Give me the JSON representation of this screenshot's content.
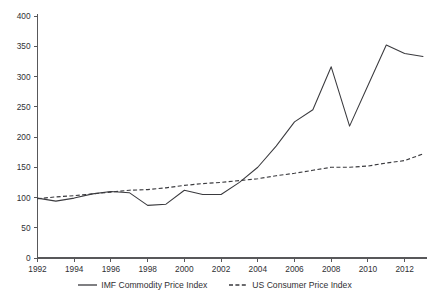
{
  "chart_data": {
    "type": "line",
    "title": "",
    "subtitle": "",
    "xlabel": "",
    "ylabel": "",
    "xlim": [
      1992,
      2013
    ],
    "ylim": [
      0,
      400
    ],
    "grid": false,
    "legend_position": "bottom",
    "x": [
      1992,
      1993,
      1994,
      1995,
      1996,
      1997,
      1998,
      1999,
      2000,
      2001,
      2002,
      2003,
      2004,
      2005,
      2006,
      2007,
      2008,
      2009,
      2010,
      2011,
      2012,
      2013
    ],
    "y_ticks": [
      0,
      50,
      100,
      150,
      200,
      250,
      300,
      350,
      400
    ],
    "y_tick_labels": [
      "0",
      "50",
      "100",
      "150",
      "200",
      "250",
      "300",
      "350",
      "400"
    ],
    "x_ticks": [
      1992,
      1994,
      1996,
      1998,
      2000,
      2002,
      2004,
      2006,
      2008,
      2010,
      2012
    ],
    "x_tick_labels": [
      "1992",
      "1994",
      "1996",
      "1998",
      "2000",
      "2002",
      "2004",
      "2006",
      "2008",
      "2010",
      "2012"
    ],
    "series": [
      {
        "name": "IMF Commodity Price Index",
        "style": "solid",
        "color": "#3a3a3e",
        "values": [
          99,
          94,
          99,
          106,
          110,
          108,
          87,
          89,
          112,
          105,
          105,
          125,
          150,
          185,
          225,
          245,
          316,
          218,
          285,
          352,
          338,
          333
        ]
      },
      {
        "name": "US Consumer Price Index",
        "style": "dashed",
        "color": "#3a3a3e",
        "values": [
          98,
          101,
          103,
          106,
          109,
          112,
          113,
          116,
          120,
          123,
          125,
          128,
          131,
          136,
          140,
          145,
          150,
          150,
          152,
          157,
          161,
          172
        ]
      }
    ]
  },
  "legend": {
    "items": [
      {
        "label": "IMF Commodity Price Index",
        "style": "solid"
      },
      {
        "label": "US Consumer Price Index",
        "style": "dashed"
      }
    ]
  }
}
